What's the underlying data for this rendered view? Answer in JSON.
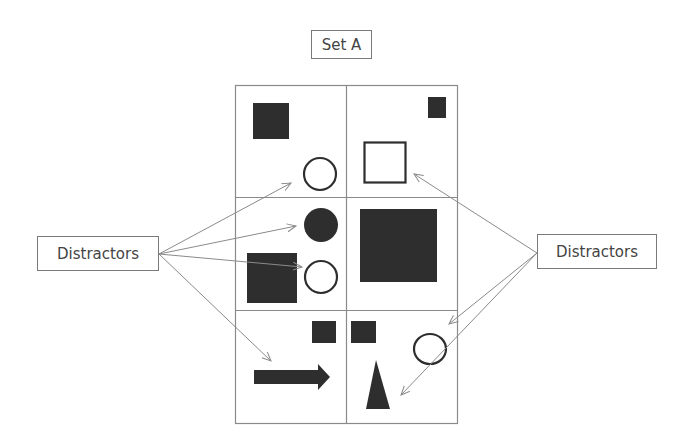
{
  "title": "Set A",
  "labels": {
    "left": "Distractors",
    "right": "Distractors"
  },
  "colors": {
    "shape_fill": "#2e2e2e",
    "grid_line": "#8a8a8a",
    "arrow": "#8a8a8a",
    "box_border": "#7a7a7a",
    "text": "#444444"
  },
  "grid": {
    "rows": 3,
    "cols": 2,
    "cells": [
      {
        "row": 0,
        "col": 0,
        "shapes": [
          "filled-square",
          "outline-circle"
        ]
      },
      {
        "row": 0,
        "col": 1,
        "shapes": [
          "small-filled-square",
          "outline-square"
        ]
      },
      {
        "row": 1,
        "col": 0,
        "shapes": [
          "filled-circle",
          "filled-square",
          "outline-circle"
        ]
      },
      {
        "row": 1,
        "col": 1,
        "shapes": [
          "large-filled-square"
        ]
      },
      {
        "row": 2,
        "col": 0,
        "shapes": [
          "small-filled-square",
          "filled-arrow"
        ]
      },
      {
        "row": 2,
        "col": 1,
        "shapes": [
          "small-filled-square",
          "outline-ellipse",
          "filled-triangle"
        ]
      }
    ]
  },
  "arrows": {
    "left_count": 4,
    "right_count": 3
  }
}
